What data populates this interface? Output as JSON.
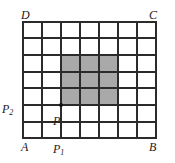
{
  "figure": {
    "type": "geometry-grid-diagram",
    "grid": {
      "columns": 7,
      "rows": 7,
      "left": 23,
      "top": 22,
      "right": 156,
      "bottom": 138,
      "line_color": "#2b2b2b",
      "border_color": "#2b2b2b",
      "cell_fill": "#ffffff"
    },
    "shaded_region": {
      "fill": "#a9a9a9",
      "col_start": 2,
      "col_end": 5,
      "row_start": 2,
      "row_end": 5,
      "width_cells": 3,
      "height_cells": 3
    },
    "point": {
      "name": "P",
      "col": 2,
      "row": 5,
      "marker_color": "#111111",
      "marker_radius": 1.8
    },
    "vertices": {
      "top_left": "D",
      "top_right": "C",
      "bottom_left": "A",
      "bottom_right": "B"
    },
    "labels": {
      "D": "D",
      "C": "C",
      "A": "A",
      "B": "B",
      "P": "P",
      "P1_base": "P",
      "P1_sub": "1",
      "P2_base": "P",
      "P2_sub": "2"
    }
  }
}
